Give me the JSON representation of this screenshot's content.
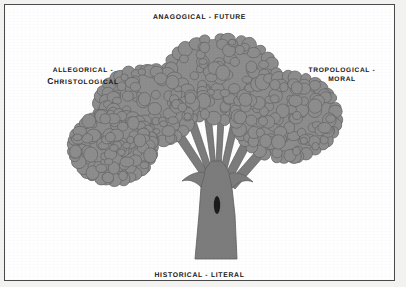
{
  "figure": {
    "alt_description": "A gray illustrated tree with a thick trunk fanning into branches and four bushy canopy clusters, labeled with the four senses of Scripture at top, left, right and bottom."
  },
  "colors": {
    "page_background": "#f2f2f0",
    "plate_background": "#ffffff",
    "frame_border": "#4a4a4a",
    "foliage_fill": "#8d8d8d",
    "foliage_outline": "#676767",
    "trunk_fill": "#7c7c7c",
    "trunk_outline": "#5e5e5e",
    "knot_fill": "#1b1b1b",
    "label_text": "#151515"
  },
  "labels": {
    "top": {
      "id": "anagogical",
      "position": "top",
      "text": "ANAGOGICAL - FUTURE",
      "sense": "ANAGOGICAL",
      "separator": "-",
      "meaning": "FUTURE"
    },
    "left": {
      "id": "allegorical",
      "position": "left",
      "line1": "ALLEGORICAL -",
      "line2_lead": "C",
      "line2_rest": "HRISTOLOGICAL",
      "sense": "ALLEGORICAL",
      "separator": "-",
      "meaning": "CHRISTOLOGICAL"
    },
    "right": {
      "id": "tropological",
      "position": "right",
      "line1": "TROPOLOGICAL -",
      "line2": "MORAL",
      "sense": "TROPOLOGICAL",
      "separator": "-",
      "meaning": "MORAL"
    },
    "bottom": {
      "id": "historical",
      "position": "bottom",
      "text": "HISTORICAL - LITERAL",
      "sense": "HISTORICAL",
      "separator": "-",
      "meaning": "LITERAL"
    }
  },
  "illustration": {
    "subject": "tree",
    "canopy_clusters": [
      {
        "name": "top-center-canopy",
        "cx": 212,
        "cy": 70,
        "rx": 60,
        "ry": 45
      },
      {
        "name": "upper-left-canopy",
        "cx": 137,
        "cy": 98,
        "rx": 52,
        "ry": 42
      },
      {
        "name": "lower-left-canopy",
        "cx": 104,
        "cy": 138,
        "rx": 44,
        "ry": 38
      },
      {
        "name": "right-canopy",
        "cx": 277,
        "cy": 108,
        "rx": 55,
        "ry": 45
      }
    ],
    "trunk": {
      "name": "tree-trunk",
      "top_y": 120,
      "base_y": 250,
      "base_width": 26
    },
    "knot": {
      "name": "trunk-knot",
      "cx": 208,
      "cy": 196,
      "rx": 3.2,
      "ry": 9
    },
    "branch_count": 7
  }
}
